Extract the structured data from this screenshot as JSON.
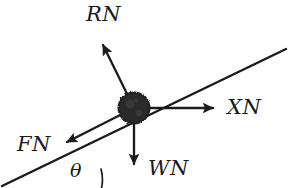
{
  "figure": {
    "kind": "free-body-diagram",
    "background_color": "#ffffff",
    "ink_color": "#1a1a1a",
    "width": 300,
    "height": 188
  },
  "incline": {
    "name": "inclined-plane-surface",
    "start": {
      "x": 2,
      "y": 186
    },
    "end": {
      "x": 286,
      "y": 49
    },
    "angle_degrees": 26
  },
  "mass": {
    "name": "point-mass-block",
    "center": {
      "x": 134,
      "y": 108
    },
    "radius": 16,
    "fill": "#1f1f1f"
  },
  "angle": {
    "symbol": "θ",
    "name": "incline-angle",
    "arc_center": {
      "x": 62,
      "y": 188
    },
    "arc_radius": 40,
    "label_position": {
      "x": 78,
      "y": 172
    }
  },
  "vectors": [
    {
      "id": "RN",
      "label": "RN",
      "description": "normal reaction force",
      "from": {
        "x": 134,
        "y": 108
      },
      "to": {
        "x": 99,
        "y": 37
      },
      "direction_degrees": 116
    },
    {
      "id": "XN",
      "label": "XN",
      "description": "horizontal component force",
      "from": {
        "x": 134,
        "y": 108
      },
      "to": {
        "x": 223,
        "y": 108
      },
      "direction_degrees": 0
    },
    {
      "id": "FN",
      "label": "FN",
      "description": "friction force along incline",
      "from": {
        "x": 134,
        "y": 108
      },
      "to": {
        "x": 58,
        "y": 146
      },
      "direction_degrees": 207
    },
    {
      "id": "WN",
      "label": "WN",
      "description": "weight force downward",
      "from": {
        "x": 134,
        "y": 108
      },
      "to": {
        "x": 134,
        "y": 174
      },
      "direction_degrees": 270
    }
  ]
}
